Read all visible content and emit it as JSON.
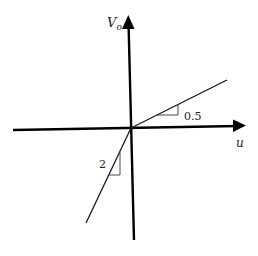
{
  "diagram": {
    "type": "piecewise-linear-graph",
    "axes": {
      "x_label": "u",
      "y_label_main": "V",
      "y_label_sub": "o"
    },
    "segments": [
      {
        "name": "positive-u-segment",
        "slope": 0.5,
        "slope_label": "0.5"
      },
      {
        "name": "negative-u-segment",
        "slope": 2,
        "slope_label": "2"
      }
    ],
    "colors": {
      "axis": "#000000",
      "line": "#1a1a1a",
      "background": "#ffffff"
    }
  }
}
